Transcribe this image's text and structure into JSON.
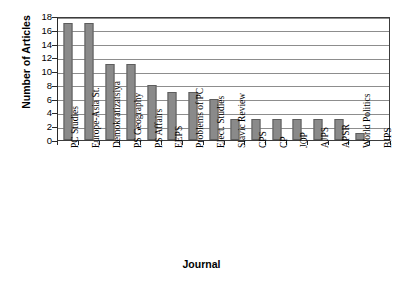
{
  "chart_data": {
    "type": "bar",
    "title": "",
    "xlabel": "Journal",
    "ylabel": "Number of Articles",
    "ylim": [
      0,
      18
    ],
    "ytick_step": 2,
    "yticks": [
      0,
      2,
      4,
      6,
      8,
      10,
      12,
      14,
      16,
      18
    ],
    "grid": true,
    "legend": "none",
    "orientation": "vertical",
    "bar_color": "#8a8a8a",
    "bar_border_color": "#5d5d5d",
    "gridline_color": "#8d8d8d",
    "axis_color": "#2a2a2a",
    "plot_background": "#ffffff",
    "categories": [
      "PC Studies",
      "Europe-Asia St.",
      "Demokratizatsiya",
      "PS Geography",
      "PS Affairs",
      "EEPS",
      "Problems of PC",
      "Elect. Studies",
      "Slavic Review",
      "CPS",
      "CP",
      "JOP",
      "AJPS",
      "APSR",
      "World Politics",
      "BJPS"
    ],
    "values": [
      17,
      17,
      11,
      11,
      8,
      7,
      7,
      6,
      3,
      3,
      3,
      3,
      3,
      3,
      1,
      0
    ]
  }
}
